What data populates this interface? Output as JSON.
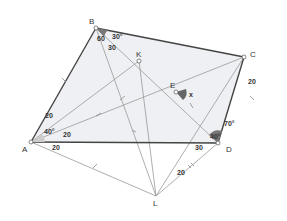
{
  "diagram": {
    "type": "geometry",
    "points": {
      "A": {
        "label": "A",
        "x": 31,
        "y": 142
      },
      "B": {
        "label": "B",
        "x": 96,
        "y": 28
      },
      "C": {
        "label": "C",
        "x": 244,
        "y": 57
      },
      "D": {
        "label": "D",
        "x": 218,
        "y": 143
      },
      "E": {
        "label": "E",
        "x": 176,
        "y": 92
      },
      "K": {
        "label": "K",
        "x": 139,
        "y": 61
      },
      "L": {
        "label": "L",
        "x": 156,
        "y": 196
      }
    },
    "labels": {
      "angle_B_upper": "30°",
      "angle_B_lower": "60",
      "seg_B_30": "30",
      "angle_A": "40°",
      "seg_AB_20": "20",
      "seg_AE_20": "20",
      "seg_AD_20": "20",
      "angle_E": "x",
      "angle_D_upper": "70°",
      "angle_D_lower": "40°",
      "seg_DA_30": "30",
      "seg_CD_20": "20",
      "seg_DL_20": "20"
    },
    "colors": {
      "fill": "#eef0f3",
      "edge": "#444444",
      "thin": "#999999",
      "angle": "#777777"
    }
  }
}
